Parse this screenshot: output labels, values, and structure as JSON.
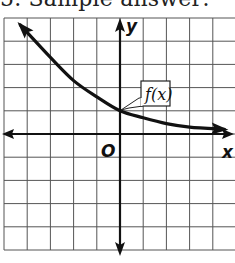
{
  "caption": "5. Sample answer:",
  "chart_data": {
    "type": "line",
    "title": "",
    "xlabel": "x",
    "ylabel": "y",
    "origin_label": "O",
    "series": [
      {
        "name": "f(x)",
        "description": "decreasing exponential decay curve, passes through (0,1), horizontal asymptote y=0",
        "x": [
          -4.3,
          -3,
          -2,
          -1,
          0,
          1,
          2,
          3,
          4.5
        ],
        "values": [
          4.7,
          3.3,
          2.3,
          1.6,
          1.0,
          0.7,
          0.45,
          0.3,
          0.2
        ]
      }
    ],
    "annotations": [
      {
        "text": "f(x)",
        "points_to": [
          0,
          1
        ]
      }
    ],
    "xlim": [
      -5,
      5
    ],
    "ylim": [
      -5,
      5
    ],
    "grid": true,
    "grid_step": 1,
    "tick_labels": false
  }
}
